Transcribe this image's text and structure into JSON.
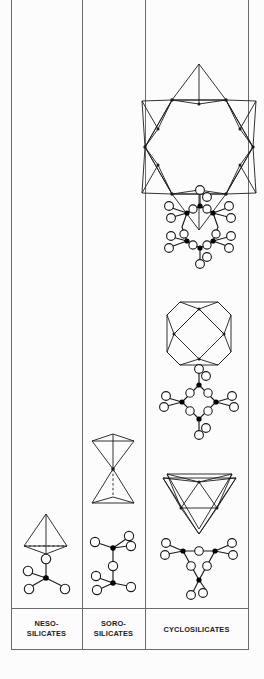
{
  "figure": {
    "background_color": "#fcfcfc",
    "line_color": "#1b1b1b",
    "oxygen_fill": "#ffffff",
    "silicon_fill": "#000000",
    "border_color": "#6b6b6b"
  },
  "columns": [
    {
      "id": "neso",
      "label_line1": "NESO-",
      "label_line2": "SILICATES",
      "x_left": 11,
      "x_right": 82,
      "structures": [
        {
          "kind": "polyhedral",
          "name": "single-tetrahedron",
          "tetrahedra": 1
        },
        {
          "kind": "ball-and-stick",
          "name": "sio4-monomer",
          "silicon_count": 1,
          "oxygen_count": 4
        }
      ]
    },
    {
      "id": "soro",
      "label_line1": "SORO-",
      "label_line2": "SILICATES",
      "x_left": 82,
      "x_right": 145,
      "structures": [
        {
          "kind": "polyhedral",
          "name": "double-tetrahedron",
          "tetrahedra": 2
        },
        {
          "kind": "ball-and-stick",
          "name": "si2o7-dimer",
          "silicon_count": 2,
          "oxygen_count": 7
        }
      ]
    },
    {
      "id": "cyclo",
      "label_line1": "CYCLOSILICATES",
      "label_line2": "",
      "x_left": 145,
      "x_right": 248,
      "structures": [
        {
          "kind": "polyhedral",
          "name": "six-membered-ring",
          "tetrahedra": 6
        },
        {
          "kind": "ball-and-stick",
          "name": "si6o18-ring",
          "silicon_count": 6,
          "oxygen_count": 18
        },
        {
          "kind": "polyhedral",
          "name": "four-membered-ring",
          "tetrahedra": 4
        },
        {
          "kind": "ball-and-stick",
          "name": "si4o12-ring",
          "silicon_count": 4,
          "oxygen_count": 12
        },
        {
          "kind": "polyhedral",
          "name": "three-membered-ring",
          "tetrahedra": 3
        },
        {
          "kind": "ball-and-stick",
          "name": "si3o9-ring",
          "silicon_count": 3,
          "oxygen_count": 9
        }
      ]
    }
  ],
  "label_row": {
    "y_top": 608,
    "y_bottom": 650,
    "neso_label_line1": "NESO-",
    "neso_label_line2": "SILICATES",
    "soro_label_line1": "SORO-",
    "soro_label_line2": "SILICATES",
    "cyclo_label": "CYCLOSILICATES"
  }
}
